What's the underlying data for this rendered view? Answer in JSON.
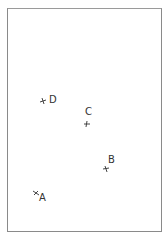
{
  "diagram": {
    "frame_color": "#8a8a8a",
    "marker_color": "#444444",
    "points": [
      {
        "label": "D",
        "x": 43,
        "y": 101,
        "label_dx": 6,
        "label_dy": -6
      },
      {
        "label": "C",
        "x": 87,
        "y": 124,
        "label_dx": -2,
        "label_dy": -14
      },
      {
        "label": "B",
        "x": 106,
        "y": 169,
        "label_dx": 3,
        "label_dy": -12
      },
      {
        "label": "A",
        "x": 36,
        "y": 193,
        "label_dx": 3,
        "label_dy": 0
      }
    ]
  }
}
